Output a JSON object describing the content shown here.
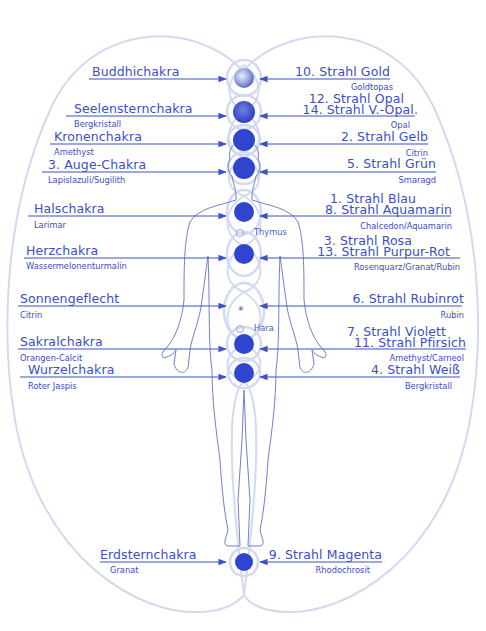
{
  "diagram": {
    "colors": {
      "text": "#3a4fc4",
      "arrow": "#3d52c6",
      "chakra_fill": "#2f44cf",
      "aura_outline": "#d3daf0",
      "body_outline": "#6e7fd2",
      "background": "#ffffff"
    },
    "left_labels": [
      {
        "chakra": "Buddhichakra",
        "stone": ""
      },
      {
        "chakra": "Seelensternchakra",
        "stone": "Bergkristall"
      },
      {
        "chakra": "Kronenchakra",
        "stone": "Amethyst"
      },
      {
        "chakra": "3. Auge-Chakra",
        "stone": "Lapislazuli/Sugilith"
      },
      {
        "chakra": "Halschakra",
        "stone": "Larimar"
      },
      {
        "chakra": "Herzchakra",
        "stone": "Wassermelonenturmalin"
      },
      {
        "chakra": "Sonnengeflecht",
        "stone": "Citrin"
      },
      {
        "chakra": "Sakralchakra",
        "stone": "Orangen-Calcit"
      },
      {
        "chakra": "Wurzelchakra",
        "stone": "Roter Jaspis"
      },
      {
        "chakra": "Erdsternchakra",
        "stone": "Granat"
      }
    ],
    "right_labels": [
      {
        "rays": [
          "10. Strahl Gold"
        ],
        "stone": "Goldtopas"
      },
      {
        "rays": [
          "12. Strahl Opal",
          "14. Strahl V.-Opal."
        ],
        "stone": "Opal"
      },
      {
        "rays": [
          "2. Strahl Gelb"
        ],
        "stone": "Citrin"
      },
      {
        "rays": [
          "5. Strahl Grün"
        ],
        "stone": "Smaragd"
      },
      {
        "rays": [
          "1. Strahl Blau",
          "8. Strahl Aquamarin"
        ],
        "stone": "Chalcedon/Aquamarin"
      },
      {
        "rays": [
          "3. Strahl Rosa",
          "13. Strahl Purpur-Rot"
        ],
        "stone": "Rosenquarz/Granat/Rubin"
      },
      {
        "rays": [
          "6. Strahl Rubinrot"
        ],
        "stone": "Rubin"
      },
      {
        "rays": [
          "7. Strahl Violett",
          "11. Strahl Pfirsich"
        ],
        "stone": "Amethyst/Carneol"
      },
      {
        "rays": [
          "4. Strahl Weiß"
        ],
        "stone": "Bergkristall"
      },
      {
        "rays": [
          "9. Strahl Magenta"
        ],
        "stone": "Rhodochrosit"
      }
    ],
    "minor_points": [
      {
        "label": "Thymus"
      },
      {
        "label": "Hara"
      }
    ],
    "center_symbol": "*"
  }
}
